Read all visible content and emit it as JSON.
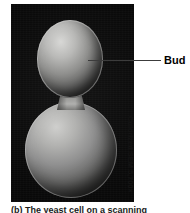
{
  "figure": {
    "name": "budding-yeast-micrograph",
    "caption": "(b) The yeast cell on a scanning",
    "micrograph": {
      "background_color": "#0a0a0a",
      "specimen": "budding yeast cell",
      "parts": {
        "bud": "bud",
        "mother_cell": "mother cell",
        "bud_neck": "bud neck",
        "bud_scars": "bud scars"
      }
    },
    "labels": [
      {
        "id": "bud",
        "text": "Bud",
        "color": "#000000",
        "leader_color": "#3c3c3c"
      }
    ],
    "credit": {
      "text": "Colorized SEM 5,700×",
      "technique": "Colorized SEM",
      "magnification": "5,700×",
      "orientation": "vertical",
      "color": "#141414"
    }
  }
}
